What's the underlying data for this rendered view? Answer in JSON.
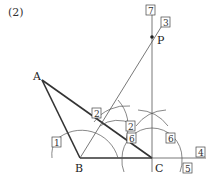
{
  "title": "(2)",
  "points": {
    "A": {
      "label": "A",
      "x": 42,
      "y": 80
    },
    "B": {
      "label": "B",
      "x": 80,
      "y": 158
    },
    "C": {
      "label": "C",
      "x": 152,
      "y": 158
    },
    "P": {
      "label": "P",
      "x": 152,
      "y": 37
    }
  },
  "step_labels": [
    {
      "id": "7",
      "x": 147,
      "y": 6
    },
    {
      "id": "3",
      "x": 162,
      "y": 22
    },
    {
      "id": "2",
      "x": 90,
      "y": 114
    },
    {
      "id": "2",
      "x": 126,
      "y": 130
    },
    {
      "id": "6",
      "x": 127,
      "y": 141
    },
    {
      "id": "6",
      "x": 165,
      "y": 141
    },
    {
      "id": "1",
      "x": 52,
      "y": 141
    },
    {
      "id": "4",
      "x": 196,
      "y": 150
    },
    {
      "id": "5",
      "x": 183,
      "y": 164
    }
  ],
  "colors": {
    "line": "#333333",
    "thin": "#666666"
  }
}
